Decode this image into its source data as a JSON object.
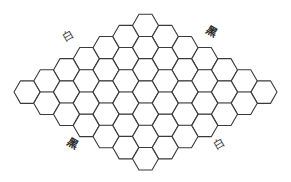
{
  "board": {
    "type": "hex-rhombus",
    "size": 7,
    "orientation": "flat-top",
    "top_cell_center": [
      145.5,
      25.5
    ],
    "step_down_left": [
      -19.75,
      11.1
    ],
    "step_down_right": [
      19.75,
      11.1
    ],
    "hex_side": 13.0,
    "line_color": "#3a3a3a",
    "fill_color": "#ffffff"
  },
  "labels": [
    {
      "id": "top-left",
      "text": "白",
      "side": "white",
      "x": 69,
      "y": 38,
      "rotate": -30
    },
    {
      "id": "top-right",
      "text": "黑",
      "side": "black",
      "x": 211,
      "y": 33,
      "rotate": 30
    },
    {
      "id": "bottom-left",
      "text": "黑",
      "side": "black",
      "x": 72,
      "y": 145,
      "rotate": 30
    },
    {
      "id": "bottom-right",
      "text": "白",
      "side": "white",
      "x": 220,
      "y": 146,
      "rotate": -30
    }
  ]
}
